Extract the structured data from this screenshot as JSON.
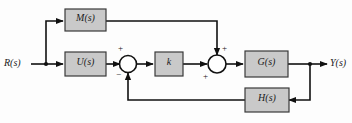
{
  "diagram": {
    "background_color": "#fdfdfd",
    "block_fill_color": "#c9c9c9",
    "block_stroke_color": "#3a3a3a",
    "line_color": "#111111",
    "signals": {
      "input": "R(s)",
      "output": "Y(s)"
    },
    "blocks": [
      {
        "id": "feedforward",
        "label": "M(s)"
      },
      {
        "id": "controller",
        "label": "U(s)"
      },
      {
        "id": "gain",
        "label": "k"
      },
      {
        "id": "plant",
        "label": "G(s)"
      },
      {
        "id": "feedback",
        "label": "H(s)"
      }
    ],
    "summing_junctions": [
      {
        "id": "summer-1",
        "signs": [
          {
            "port": "left",
            "sign": "+"
          },
          {
            "port": "bottom",
            "sign": "−"
          }
        ]
      },
      {
        "id": "summer-2",
        "signs": [
          {
            "port": "top",
            "sign": "+"
          },
          {
            "port": "left",
            "sign": "+"
          }
        ]
      }
    ]
  }
}
